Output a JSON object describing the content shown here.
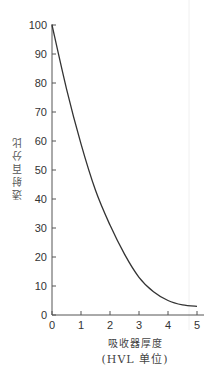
{
  "chart_data": {
    "type": "line",
    "title": "",
    "xlabel": "吸收器厚度",
    "xlabel_unit": "(HVL 单位)",
    "ylabel": "透射百分比",
    "xlim": [
      0,
      5
    ],
    "ylim": [
      0,
      100
    ],
    "x_ticks": [
      "0",
      "1",
      "2",
      "3",
      "4",
      "5"
    ],
    "y_ticks": [
      "0",
      "10",
      "20",
      "30",
      "40",
      "50",
      "60",
      "70",
      "80",
      "90",
      "100"
    ],
    "grid": false,
    "legend": null,
    "series": [
      {
        "name": "透射百分比",
        "x": [
          0,
          0.5,
          1,
          1.5,
          2,
          2.5,
          3,
          3.5,
          4,
          4.5,
          5
        ],
        "values": [
          100,
          78,
          59,
          43,
          31,
          21,
          13,
          8,
          5,
          3.5,
          3
        ]
      }
    ],
    "colors": {
      "line": "#333333",
      "axis": "#555555"
    }
  }
}
